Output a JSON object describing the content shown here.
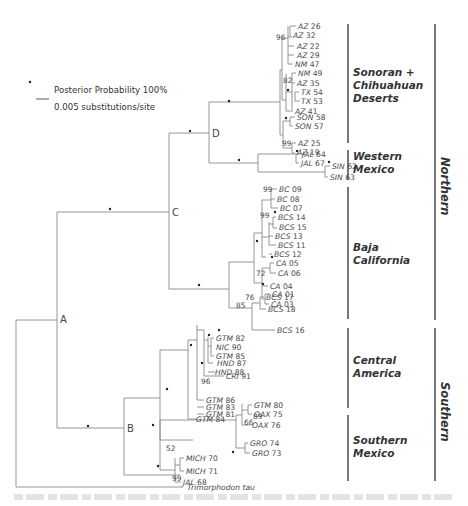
{
  "legend": {
    "dot_label": "Posterior Probability 100%",
    "scale_label": "0.005 substitutions/site"
  },
  "nodes": {
    "A": "A",
    "B": "B",
    "C": "C",
    "D": "D"
  },
  "regions": {
    "sonoran": [
      "Sonoran +",
      "Chihuahuan",
      "Deserts"
    ],
    "western": [
      "Western",
      "Mexico"
    ],
    "baja": [
      "Baja",
      "California"
    ],
    "central": [
      "Central",
      "America"
    ],
    "southern_mexico": [
      "Southern",
      "Mexico"
    ]
  },
  "groups": {
    "northern": "Northern",
    "southern": "Southern"
  },
  "outgroup": "Trimorphodon tau",
  "tips": [
    {
      "code": "AZ",
      "num": "26"
    },
    {
      "code": "AZ",
      "num": "32"
    },
    {
      "code": "AZ",
      "num": "22"
    },
    {
      "code": "AZ",
      "num": "29"
    },
    {
      "code": "NM",
      "num": "47"
    },
    {
      "code": "NM",
      "num": "49"
    },
    {
      "code": "AZ",
      "num": "35"
    },
    {
      "code": "TX",
      "num": "54"
    },
    {
      "code": "TX",
      "num": "53"
    },
    {
      "code": "AZ",
      "num": "41"
    },
    {
      "code": "SON",
      "num": "58"
    },
    {
      "code": "SON",
      "num": "57"
    },
    {
      "code": "AZ",
      "num": "25"
    },
    {
      "code": "AZ",
      "num": "19"
    },
    {
      "code": "JAL",
      "num": "64"
    },
    {
      "code": "JAL",
      "num": "67"
    },
    {
      "code": "SIN",
      "num": "62"
    },
    {
      "code": "SIN",
      "num": "63"
    },
    {
      "code": "BC",
      "num": "09"
    },
    {
      "code": "BC",
      "num": "08"
    },
    {
      "code": "BC",
      "num": "07"
    },
    {
      "code": "BCS",
      "num": "14"
    },
    {
      "code": "BCS",
      "num": "15"
    },
    {
      "code": "BCS",
      "num": "13"
    },
    {
      "code": "BCS",
      "num": "11"
    },
    {
      "code": "BCS",
      "num": "12"
    },
    {
      "code": "CA",
      "num": "05"
    },
    {
      "code": "CA",
      "num": "06"
    },
    {
      "code": "CA",
      "num": "04"
    },
    {
      "code": "CA",
      "num": "01"
    },
    {
      "code": "CA",
      "num": "03"
    },
    {
      "code": "BCS",
      "num": "17"
    },
    {
      "code": "BCS",
      "num": "18"
    },
    {
      "code": "BCS",
      "num": "16"
    },
    {
      "code": "GTM",
      "num": "82"
    },
    {
      "code": "NIC",
      "num": "90"
    },
    {
      "code": "GTM",
      "num": "85"
    },
    {
      "code": "HND",
      "num": "87"
    },
    {
      "code": "HND",
      "num": "88"
    },
    {
      "code": "CRI",
      "num": "91"
    },
    {
      "code": "GTM",
      "num": "86"
    },
    {
      "code": "GTM",
      "num": "83"
    },
    {
      "code": "GTM",
      "num": "81"
    },
    {
      "code": "GTM",
      "num": "84"
    },
    {
      "code": "GTM",
      "num": "80"
    },
    {
      "code": "OAX",
      "num": "75"
    },
    {
      "code": "OAX",
      "num": "76"
    },
    {
      "code": "GRO",
      "num": "74"
    },
    {
      "code": "GRO",
      "num": "73"
    },
    {
      "code": "MICH",
      "num": "70"
    },
    {
      "code": "MICH",
      "num": "71"
    },
    {
      "code": "JAL",
      "num": "68"
    }
  ],
  "support_values": [
    "96",
    "82",
    "99",
    "99",
    "99",
    "72",
    "76",
    "85",
    "96",
    "89",
    "66",
    "52",
    "99"
  ],
  "colors": {
    "branch": "#8a8a8a",
    "text": "#4a4a4a",
    "bar": "#555555"
  }
}
